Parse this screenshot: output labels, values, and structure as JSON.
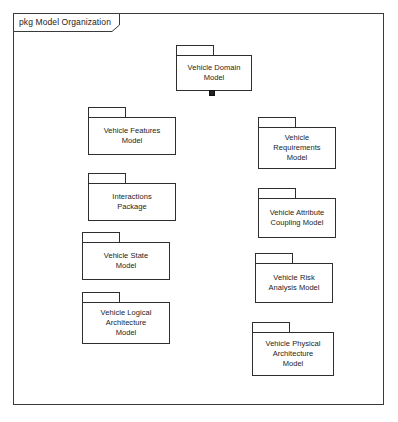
{
  "diagram": {
    "kind": "uml-package-diagram",
    "frame": {
      "label": "pkg Model Organization",
      "keyword": "pkg",
      "name": "Model Organization"
    },
    "root_package": {
      "id": "vehicle-domain-model",
      "label": "Vehicle Domain\nModel",
      "x": 176,
      "y": 45,
      "width": 76,
      "height": 46
    },
    "left_packages": [
      {
        "id": "vehicle-features-model",
        "label": "Vehicle Features\nModel",
        "x": 88,
        "y": 107,
        "width": 88,
        "height": 48
      },
      {
        "id": "interactions-package",
        "label": "Interactions\nPackage",
        "x": 88,
        "y": 173,
        "width": 88,
        "height": 48
      },
      {
        "id": "vehicle-state-model",
        "label": "Vehicle State\nModel",
        "x": 82,
        "y": 232,
        "width": 88,
        "height": 48
      },
      {
        "id": "vehicle-logical-architecture-model",
        "label": "Vehicle Logical\nArchitecture\nModel",
        "x": 82,
        "y": 292,
        "width": 88,
        "height": 52
      }
    ],
    "right_packages": [
      {
        "id": "vehicle-requirements-model",
        "label": "Vehicle\nRequirements\nModel",
        "x": 258,
        "y": 117,
        "width": 78,
        "height": 52
      },
      {
        "id": "vehicle-attribute-coupling-model",
        "label": "Vehicle Attribute\nCoupling Model",
        "x": 258,
        "y": 188,
        "width": 78,
        "height": 50
      },
      {
        "id": "vehicle-risk-analysis-model",
        "label": "Vehicle Risk\nAnalysis Model",
        "x": 255,
        "y": 253,
        "width": 78,
        "height": 50
      },
      {
        "id": "vehicle-physical-architecture-model",
        "label": "Vehicle Physical\nArchitecture\nModel",
        "x": 252,
        "y": 322,
        "width": 82,
        "height": 54
      }
    ],
    "connector": {
      "style": "composition-tree",
      "trunk_x": 212,
      "trunk_top": 93,
      "trunk_bottom": 349,
      "anchor_symbol": "filled-square",
      "left_branch_y": [
        137,
        203,
        262,
        320
      ],
      "right_branch_y": [
        147,
        213,
        272,
        349
      ]
    },
    "colors": {
      "line": "#2e2e2e",
      "frame_line": "#3a3a3a",
      "text": "#1c1c1c",
      "background": "#ffffff",
      "anchor_fill": "#222222"
    }
  }
}
